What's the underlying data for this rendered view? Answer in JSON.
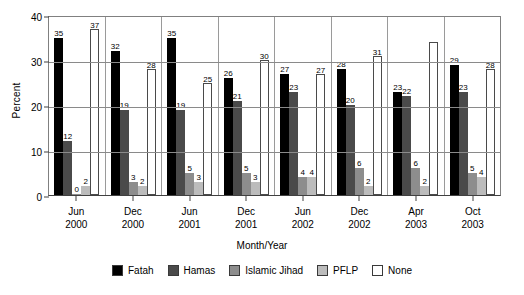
{
  "chart_data": {
    "type": "bar",
    "title": "",
    "xlabel": "Month/Year",
    "ylabel": "Percent",
    "ylim": [
      0,
      40
    ],
    "yticks": [
      0,
      10,
      20,
      30,
      40
    ],
    "grid": true,
    "legend_position": "bottom",
    "categories": [
      "Jun\n2000",
      "Dec\n2000",
      "Jun\n2001",
      "Dec\n2001",
      "Jun\n2002",
      "Dec\n2002",
      "Apr\n2003",
      "Oct\n2003"
    ],
    "category_lines": [
      [
        "Jun",
        "2000"
      ],
      [
        "Dec",
        "2000"
      ],
      [
        "Jun",
        "2001"
      ],
      [
        "Dec",
        "2001"
      ],
      [
        "Jun",
        "2002"
      ],
      [
        "Dec",
        "2002"
      ],
      [
        "Apr",
        "2003"
      ],
      [
        "Oct",
        "2003"
      ]
    ],
    "series": [
      {
        "name": "Fatah",
        "color": "#000000",
        "values": [
          35,
          32,
          35,
          26,
          27,
          28,
          23,
          29
        ],
        "labels": [
          "35",
          "32",
          "35",
          "26",
          "27",
          "28",
          "23",
          "29"
        ]
      },
      {
        "name": "Hamas",
        "color": "#4a4a4a",
        "values": [
          12,
          19,
          19,
          21,
          23,
          20,
          22,
          23
        ],
        "labels": [
          "12",
          "19",
          "19",
          "21",
          "23",
          "20",
          "22",
          "23"
        ]
      },
      {
        "name": "Islamic Jihad",
        "color": "#8d8d8d",
        "values": [
          0,
          3,
          5,
          5,
          4,
          6,
          6,
          5
        ],
        "labels": [
          "0",
          "3",
          "5",
          "5",
          "4",
          "6",
          "6",
          "5"
        ]
      },
      {
        "name": "PFLP",
        "color": "#bcbcbc",
        "values": [
          2,
          2,
          3,
          3,
          4,
          2,
          2,
          4
        ],
        "labels": [
          "2",
          "2",
          "3",
          "3",
          "4",
          "2",
          "2",
          "4"
        ]
      },
      {
        "name": "None",
        "color": "#ffffff",
        "values": [
          37,
          28,
          25,
          30,
          27,
          31,
          34,
          28
        ],
        "labels": [
          "37",
          "28",
          "25",
          "30",
          "27",
          "31",
          "",
          "28"
        ]
      }
    ]
  }
}
